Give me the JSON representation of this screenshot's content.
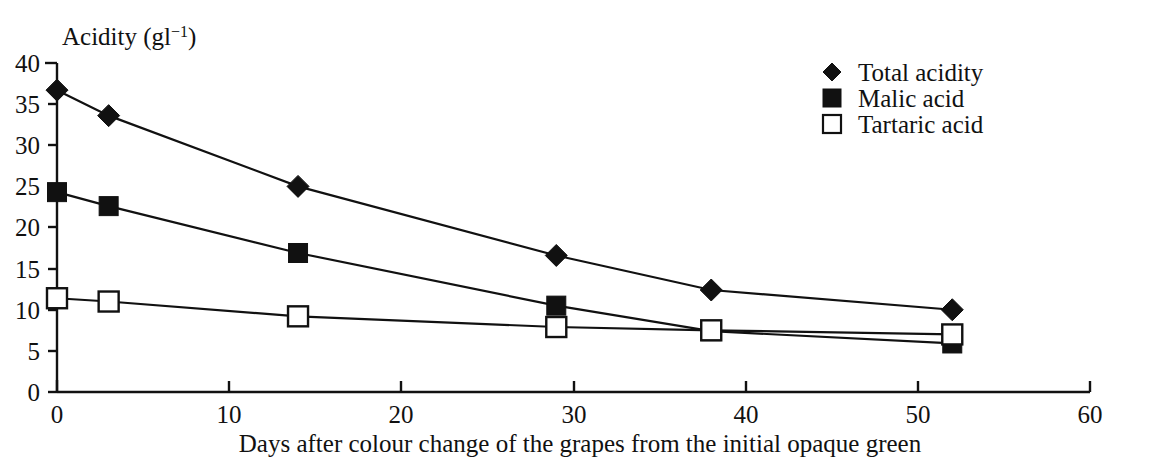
{
  "chart_data": {
    "type": "line",
    "title": "",
    "ylabel": "Acidity (gl−1)",
    "ylabel_base": "Acidity (gl",
    "ylabel_sup": "−1",
    "ylabel_close": ")",
    "xlabel": "Days after colour change of the grapes from the initial opaque green",
    "xlim": [
      0,
      60
    ],
    "ylim": [
      0,
      40
    ],
    "xticks": [
      0,
      10,
      20,
      30,
      40,
      50,
      60
    ],
    "yticks": [
      0,
      5,
      10,
      15,
      20,
      25,
      30,
      35,
      40
    ],
    "xtick_labels": [
      "0",
      "10",
      "20",
      "30",
      "40",
      "50",
      "60"
    ],
    "ytick_labels": [
      "0",
      "5",
      "10",
      "15",
      "20",
      "25",
      "30",
      "35",
      "40"
    ],
    "grid": false,
    "legend_position": "top-right",
    "x": [
      0,
      3,
      14,
      29,
      38,
      52
    ],
    "series": [
      {
        "name": "Total acidity",
        "marker": "filled-diamond",
        "color": "#111111",
        "values": [
          36.7,
          33.6,
          25.0,
          16.6,
          12.4,
          10.0
        ]
      },
      {
        "name": "Malic acid",
        "marker": "filled-square",
        "color": "#111111",
        "values": [
          24.3,
          22.6,
          16.9,
          10.5,
          7.4,
          5.9
        ]
      },
      {
        "name": "Tartaric acid",
        "marker": "open-square",
        "color": "#111111",
        "values": [
          11.4,
          11.0,
          9.2,
          7.9,
          7.5,
          7.0
        ]
      }
    ]
  },
  "legend": {
    "items": [
      {
        "label": "Total acidity",
        "marker": "filled-diamond"
      },
      {
        "label": "Malic acid",
        "marker": "filled-square"
      },
      {
        "label": "Tartaric acid",
        "marker": "open-square"
      }
    ]
  },
  "colors": {
    "ink": "#111111",
    "background": "#ffffff"
  }
}
